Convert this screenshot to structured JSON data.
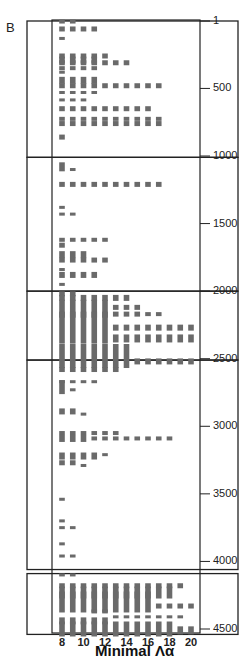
{
  "panel_label": "B",
  "chart_data": {
    "type": "heatmap",
    "title": "",
    "xlabel": "Minimal Λα",
    "ylabel": "",
    "x_ticks": [
      8,
      10,
      12,
      14,
      16,
      18,
      20
    ],
    "x_values": [
      8,
      9,
      10,
      11,
      12,
      13,
      14,
      15,
      16,
      17,
      18,
      19,
      20
    ],
    "y_ticks": [
      1,
      500,
      1000,
      1500,
      2000,
      2500,
      3000,
      3500,
      4000,
      4500
    ],
    "ylim": [
      1,
      4550
    ],
    "y_inverted": true,
    "grid": false,
    "highlight_boxes": [
      {
        "y_start": 1,
        "y_end": 1010
      },
      {
        "y_start": 1010,
        "y_end": 2000
      },
      {
        "y_start": 2000,
        "y_end": 2510
      },
      {
        "y_start": 2510,
        "y_end": 4060
      },
      {
        "y_start": 4090,
        "y_end": 4540
      }
    ],
    "marks": [
      {
        "y": 5,
        "x_from": 8,
        "x_to": 9,
        "h": 8
      },
      {
        "y": 60,
        "x_from": 8,
        "x_to": 11,
        "h": 10
      },
      {
        "y": 130,
        "x_from": 8,
        "x_to": 8,
        "h": 6
      },
      {
        "y": 260,
        "x_from": 8,
        "x_to": 12,
        "h": 10
      },
      {
        "y": 290,
        "x_from": 8,
        "x_to": 11,
        "h": 14
      },
      {
        "y": 310,
        "x_from": 8,
        "x_to": 14,
        "h": 10
      },
      {
        "y": 350,
        "x_from": 8,
        "x_to": 11,
        "h": 8
      },
      {
        "y": 380,
        "x_from": 8,
        "x_to": 8,
        "h": 6
      },
      {
        "y": 440,
        "x_from": 8,
        "x_to": 11,
        "h": 14
      },
      {
        "y": 480,
        "x_from": 8,
        "x_to": 17,
        "h": 10
      },
      {
        "y": 530,
        "x_from": 8,
        "x_to": 11,
        "h": 6
      },
      {
        "y": 585,
        "x_from": 8,
        "x_to": 10,
        "h": 6
      },
      {
        "y": 650,
        "x_from": 8,
        "x_to": 16,
        "h": 10
      },
      {
        "y": 725,
        "x_from": 8,
        "x_to": 17,
        "h": 8
      },
      {
        "y": 760,
        "x_from": 8,
        "x_to": 17,
        "h": 10
      },
      {
        "y": 860,
        "x_from": 8,
        "x_to": 8,
        "h": 10
      },
      {
        "y": 1080,
        "x_from": 8,
        "x_to": 8,
        "h": 18
      },
      {
        "y": 1100,
        "x_from": 9,
        "x_to": 9,
        "h": 6
      },
      {
        "y": 1210,
        "x_from": 8,
        "x_to": 17,
        "h": 10
      },
      {
        "y": 1380,
        "x_from": 8,
        "x_to": 8,
        "h": 6
      },
      {
        "y": 1430,
        "x_from": 8,
        "x_to": 9,
        "h": 6
      },
      {
        "y": 1620,
        "x_from": 8,
        "x_to": 12,
        "h": 8
      },
      {
        "y": 1660,
        "x_from": 8,
        "x_to": 8,
        "h": 10
      },
      {
        "y": 1730,
        "x_from": 8,
        "x_to": 10,
        "h": 14
      },
      {
        "y": 1770,
        "x_from": 8,
        "x_to": 12,
        "h": 10
      },
      {
        "y": 1840,
        "x_from": 8,
        "x_to": 8,
        "h": 6
      },
      {
        "y": 1880,
        "x_from": 8,
        "x_to": 11,
        "h": 12
      },
      {
        "y": 1950,
        "x_from": 8,
        "x_to": 8,
        "h": 6
      },
      {
        "y": 2020,
        "x_from": 8,
        "x_to": 9,
        "h": 10
      },
      {
        "y": 2050,
        "x_from": 8,
        "x_to": 14,
        "h": 12
      },
      {
        "y": 2130,
        "x_from": 8,
        "x_to": 12,
        "h": 36
      },
      {
        "y": 2120,
        "x_from": 13,
        "x_to": 15,
        "h": 10
      },
      {
        "y": 2170,
        "x_from": 13,
        "x_to": 15,
        "h": 10
      },
      {
        "y": 2170,
        "x_from": 16,
        "x_to": 17,
        "h": 8
      },
      {
        "y": 2270,
        "x_from": 8,
        "x_to": 12,
        "h": 64
      },
      {
        "y": 2270,
        "x_from": 13,
        "x_to": 20,
        "h": 12
      },
      {
        "y": 2350,
        "x_from": 13,
        "x_to": 20,
        "h": 16
      },
      {
        "y": 2480,
        "x_from": 8,
        "x_to": 14,
        "h": 48
      },
      {
        "y": 2520,
        "x_from": 15,
        "x_to": 20,
        "h": 12
      },
      {
        "y": 2580,
        "x_from": 8,
        "x_to": 13,
        "h": 10
      },
      {
        "y": 2670,
        "x_from": 8,
        "x_to": 11,
        "h": 6
      },
      {
        "y": 2710,
        "x_from": 8,
        "x_to": 8,
        "h": 28
      },
      {
        "y": 2730,
        "x_from": 9,
        "x_to": 9,
        "h": 6
      },
      {
        "y": 2890,
        "x_from": 8,
        "x_to": 9,
        "h": 12
      },
      {
        "y": 2910,
        "x_from": 10,
        "x_to": 10,
        "h": 6
      },
      {
        "y": 3050,
        "x_from": 8,
        "x_to": 13,
        "h": 8
      },
      {
        "y": 3090,
        "x_from": 8,
        "x_to": 10,
        "h": 14
      },
      {
        "y": 3090,
        "x_from": 11,
        "x_to": 18,
        "h": 8
      },
      {
        "y": 3220,
        "x_from": 8,
        "x_to": 11,
        "h": 14
      },
      {
        "y": 3210,
        "x_from": 12,
        "x_to": 12,
        "h": 6
      },
      {
        "y": 3270,
        "x_from": 8,
        "x_to": 9,
        "h": 10
      },
      {
        "y": 3290,
        "x_from": 10,
        "x_to": 10,
        "h": 6
      },
      {
        "y": 3540,
        "x_from": 8,
        "x_to": 8,
        "h": 6
      },
      {
        "y": 3700,
        "x_from": 8,
        "x_to": 8,
        "h": 6
      },
      {
        "y": 3750,
        "x_from": 8,
        "x_to": 9,
        "h": 6
      },
      {
        "y": 3870,
        "x_from": 8,
        "x_to": 8,
        "h": 6
      },
      {
        "y": 3960,
        "x_from": 8,
        "x_to": 9,
        "h": 6
      },
      {
        "y": 4100,
        "x_from": 8,
        "x_to": 9,
        "h": 6
      },
      {
        "y": 4180,
        "x_from": 8,
        "x_to": 19,
        "h": 10
      },
      {
        "y": 4230,
        "x_from": 8,
        "x_to": 18,
        "h": 24
      },
      {
        "y": 4300,
        "x_from": 8,
        "x_to": 16,
        "h": 42
      },
      {
        "y": 4330,
        "x_from": 17,
        "x_to": 20,
        "h": 10
      },
      {
        "y": 4370,
        "x_from": 11,
        "x_to": 12,
        "h": 8
      },
      {
        "y": 4410,
        "x_from": 13,
        "x_to": 19,
        "h": 6
      },
      {
        "y": 4440,
        "x_from": 8,
        "x_to": 12,
        "h": 14
      },
      {
        "y": 4500,
        "x_from": 8,
        "x_to": 18,
        "h": 30
      },
      {
        "y": 4510,
        "x_from": 19,
        "x_to": 20,
        "h": 16
      }
    ]
  }
}
